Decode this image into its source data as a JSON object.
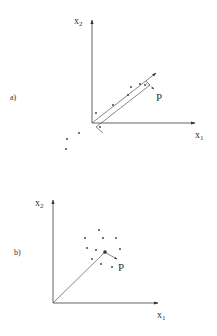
{
  "panels": [
    {
      "id": "a",
      "label": "a)",
      "axes": {
        "x_label": "x",
        "x_sub": "1",
        "y_label": "x",
        "y_sub": "2"
      },
      "point_label": "P",
      "description": "Elongated data cloud along a direction; vector from origin along principal direction with parallel band and projection to point P"
    },
    {
      "id": "b",
      "label": "b)",
      "axes": {
        "x_label": "x",
        "x_sub": "1",
        "y_label": "x",
        "y_sub": "2"
      },
      "point_label": "P",
      "description": "Isotropic data cloud around a center point; vector from origin to cloud center, with small arrow to point P"
    }
  ],
  "colors": {
    "ink": "#333333",
    "background": "#ffffff"
  }
}
